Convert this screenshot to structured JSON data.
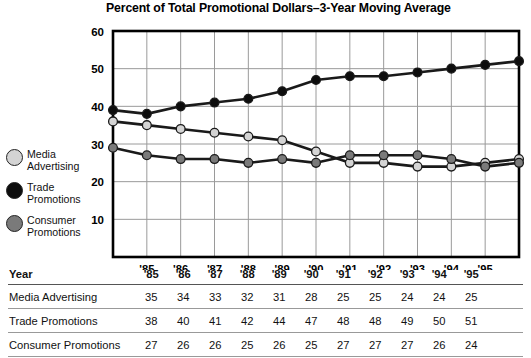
{
  "chart_data": {
    "type": "line",
    "title": "Percent of Total Promotional Dollars–3-Year Moving Average",
    "xlabel": "Year",
    "ylabel": "",
    "ylim": [
      0,
      60
    ],
    "yticks": [
      10,
      20,
      30,
      40,
      50,
      60
    ],
    "grid": true,
    "legend_position": "left",
    "categories": [
      "'85",
      "'86",
      "'87",
      "'88",
      "'89",
      "'90",
      "'91",
      "'92",
      "'93",
      "'94",
      "'95"
    ],
    "series": [
      {
        "name": "Media Advertising",
        "values": [
          35,
          34,
          33,
          32,
          31,
          28,
          25,
          25,
          24,
          24,
          25
        ],
        "marker_color": "#d4d4d4",
        "line_color": "#1a1a1a",
        "edge_values": {
          "left": 36,
          "right": 26
        }
      },
      {
        "name": "Trade Promotions",
        "values": [
          38,
          40,
          41,
          42,
          44,
          47,
          48,
          48,
          49,
          50,
          51
        ],
        "marker_color": "#0d0d0d",
        "line_color": "#1a1a1a",
        "edge_values": {
          "left": 39,
          "right": 52
        }
      },
      {
        "name": "Consumer Promotions",
        "values": [
          27,
          26,
          26,
          25,
          26,
          25,
          27,
          27,
          27,
          26,
          24
        ],
        "marker_color": "#7a7a7a",
        "line_color": "#1a1a1a",
        "edge_values": {
          "left": 29,
          "right": 25
        }
      }
    ]
  },
  "legend": {
    "items": [
      {
        "label_line1": "Media",
        "label_line2": "Advertising",
        "swatch": "#d4d4d4"
      },
      {
        "label_line1": "Trade",
        "label_line2": "Promotions",
        "swatch": "#0d0d0d"
      },
      {
        "label_line1": "Consumer",
        "label_line2": "Promotions",
        "swatch": "#7a7a7a"
      }
    ]
  },
  "table": {
    "header_label": "Year",
    "columns": [
      "'85",
      "'86",
      "'87",
      "'88",
      "'89",
      "'90",
      "'91",
      "'92",
      "'93",
      "'94",
      "'95"
    ],
    "rows": [
      {
        "label": "Media Advertising",
        "values": [
          35,
          34,
          33,
          32,
          31,
          28,
          25,
          25,
          24,
          24,
          25
        ]
      },
      {
        "label": "Trade Promotions",
        "values": [
          38,
          40,
          41,
          42,
          44,
          47,
          48,
          48,
          49,
          50,
          51
        ]
      },
      {
        "label": "Consumer Promotions",
        "values": [
          27,
          26,
          26,
          25,
          26,
          25,
          27,
          27,
          27,
          26,
          24
        ]
      }
    ]
  },
  "colors": {
    "axis": "#000000",
    "gridline": "#9a9a9a",
    "line": "#1a1a1a",
    "background": "#ffffff"
  }
}
